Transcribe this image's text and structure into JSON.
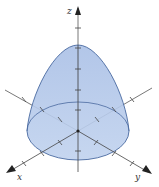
{
  "diagram": {
    "type": "3d-surface-plot",
    "surface": "paraboloid (cap) over elliptical base",
    "axes": {
      "x": {
        "label": "x"
      },
      "y": {
        "label": "y"
      },
      "z": {
        "label": "z"
      }
    },
    "colors": {
      "fill": "#b4c8e8",
      "stroke": "#4a6aa0",
      "axis": "#555555",
      "arrow": "#222222"
    }
  }
}
